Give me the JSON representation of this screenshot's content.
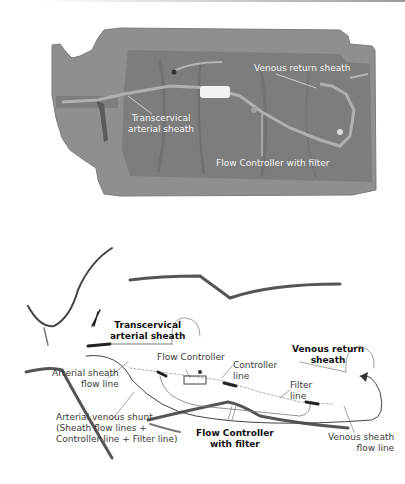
{
  "figure": {
    "top_panel": {
      "type": "grayscale photograph of mannequin with shunt setup",
      "labels": {
        "transcervical": [
          "Transcervical",
          "arterial sheath"
        ],
        "venous_return": "Venous return sheath",
        "flow_controller": "Flow Controller with filter"
      }
    },
    "bottom_panel": {
      "type": "schematic line drawing",
      "labels": {
        "transcervical": [
          "Transcervical",
          "arterial sheath"
        ],
        "flow_controller": "Flow Controller",
        "controller_line": [
          "Controller",
          "line"
        ],
        "venous_return": [
          "Venous return",
          "sheath"
        ],
        "arterial_flow_line": [
          "Arterial sheath",
          "flow line"
        ],
        "filter_line": [
          "Filter",
          "line"
        ],
        "av_shunt": [
          "Arterial venous shunt",
          "(Sheath flow lines +",
          "Controller line + Filter line)"
        ],
        "flow_controller_filter": [
          "Flow Controller",
          "with filter"
        ],
        "venous_flow_line": [
          "Venous sheath",
          "flow line"
        ]
      }
    },
    "colors": {
      "photo_body": "#8c8c8c",
      "photo_torso": "#7a7a7a",
      "photo_label": "#f2f2f2",
      "drawing_stroke": "#3a3a3a",
      "label_text": "#3a3a3a"
    }
  }
}
